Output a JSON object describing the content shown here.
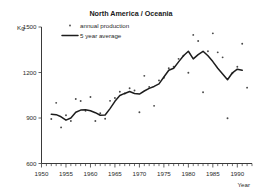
{
  "chart_data": {
    "type": "scatter",
    "title": "North America / Oceania",
    "xlabel": "Year",
    "ylabel": "Kg",
    "ylim": [
      600,
      1500
    ],
    "xlim": [
      1950,
      1993
    ],
    "yticks": [
      600,
      900,
      1200,
      1500
    ],
    "ytick_labels": [
      "600",
      "900",
      "1200",
      "1500"
    ],
    "xticks": [
      1950,
      1955,
      1960,
      1965,
      1970,
      1975,
      1980,
      1985,
      1990
    ],
    "xtick_labels": [
      "1950",
      "1955",
      "1960",
      "1965",
      "1970",
      "1975",
      "1980",
      "1985",
      "1990"
    ],
    "minor_tick_step": 1,
    "grid": false,
    "legend_position": "top-left",
    "series": [
      {
        "name": "annual production",
        "marker": "dot",
        "x": [
          1952,
          1953,
          1954,
          1955,
          1956,
          1957,
          1958,
          1959,
          1960,
          1961,
          1962,
          1963,
          1964,
          1965,
          1966,
          1967,
          1968,
          1969,
          1970,
          1971,
          1972,
          1973,
          1974,
          1975,
          1976,
          1977,
          1978,
          1979,
          1980,
          1981,
          1982,
          1983,
          1984,
          1985,
          1986,
          1987,
          1988,
          1989,
          1990,
          1991,
          1992
        ],
        "values": [
          893,
          1000,
          838,
          918,
          880,
          1025,
          1012,
          947,
          1038,
          880,
          932,
          895,
          1013,
          1032,
          1073,
          1062,
          1096,
          1081,
          938,
          1178,
          1105,
          980,
          1148,
          1165,
          1228,
          1238,
          1290,
          1310,
          1198,
          1448,
          1408,
          1070,
          1340,
          1458,
          1333,
          1300,
          898,
          1195,
          1238,
          1390,
          1100
        ]
      },
      {
        "name": "5 year average",
        "marker": "line",
        "x": [
          1952,
          1953,
          1954,
          1955,
          1956,
          1957,
          1958,
          1959,
          1960,
          1961,
          1962,
          1963,
          1964,
          1965,
          1966,
          1967,
          1968,
          1969,
          1970,
          1971,
          1972,
          1973,
          1974,
          1975,
          1976,
          1977,
          1978,
          1979,
          1980,
          1981,
          1982,
          1983,
          1984,
          1985,
          1986,
          1987,
          1988,
          1989,
          1990,
          1991
        ],
        "values": [
          925,
          922,
          908,
          886,
          900,
          938,
          952,
          955,
          948,
          935,
          918,
          920,
          962,
          1010,
          1048,
          1062,
          1075,
          1062,
          1058,
          1078,
          1095,
          1108,
          1125,
          1170,
          1215,
          1228,
          1270,
          1310,
          1340,
          1290,
          1318,
          1340,
          1310,
          1272,
          1228,
          1190,
          1152,
          1198,
          1222,
          1215
        ]
      }
    ]
  },
  "legend": {
    "items": [
      {
        "label": "annual production",
        "style": "dot"
      },
      {
        "label": "5 year average",
        "style": "line"
      }
    ]
  },
  "axes": {
    "y_unit": "Kg",
    "x_axis_name": "Year"
  }
}
